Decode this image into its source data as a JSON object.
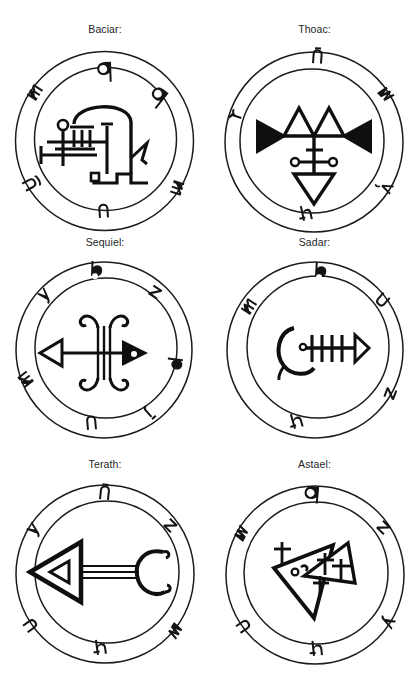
{
  "page": {
    "background_color": "#ffffff",
    "ink_color": "#100e0e",
    "layout": "2 columns x 3 rows grid of circular demon seals",
    "width": 419,
    "height": 690
  },
  "seals": [
    {
      "id": "baciar",
      "label": "Baciar:",
      "row": 1,
      "column": 1,
      "ring_glyph_count": 6,
      "ring_glyphs": [
        "glyph-q",
        "glyph-q2",
        "glyph-m",
        "glyph-m2",
        "glyph-u",
        "glyph-n"
      ],
      "center_figure": "comb-and-hook sigil: horizontal ladder bars with small circle terminal, arched dome, hooked tail and square foot"
    },
    {
      "id": "thoac",
      "label": "Thoac:",
      "row": 1,
      "column": 2,
      "ring_glyph_count": 5,
      "ring_glyphs": [
        "glyph-n",
        "glyph-w",
        "glyph-r",
        "glyph-v",
        "glyph-h"
      ],
      "center_figure": "two filled arrowheads pointing outward, twin open peaks above, barred cross with two dot terminals, open downward triangle below"
    },
    {
      "id": "sequiel",
      "label": "Sequiel:",
      "row": 2,
      "column": 1,
      "ring_glyph_count": 7,
      "ring_glyphs": [
        "glyph-b",
        "glyph-y",
        "glyph-z",
        "glyph-m",
        "glyph-p",
        "glyph-j",
        "glyph-n"
      ],
      "center_figure": "double-line vertical column with scrolled hooks top and bottom, open left arrowhead and filled right arrowhead on crossbar"
    },
    {
      "id": "sadar",
      "label": "Sadar:",
      "row": 2,
      "column": 2,
      "ring_glyph_count": 5,
      "ring_glyphs": [
        "glyph-b",
        "glyph-u",
        "glyph-m",
        "glyph-z",
        "glyph-h"
      ],
      "center_figure": "fishbone sigil: crescent with dot at left, spine with four vertical ribs, small open triangle head at right"
    },
    {
      "id": "terath",
      "label": "Terath:",
      "row": 3,
      "column": 1,
      "ring_glyph_count": 6,
      "ring_glyphs": [
        "glyph-n",
        "glyph-z",
        "glyph-y",
        "glyph-w",
        "glyph-u",
        "glyph-h"
      ],
      "center_figure": "left-pointing hollow triangle with inner triangle, triple-line shaft, scrolled C crescent at right"
    },
    {
      "id": "astael",
      "label": "Astael:",
      "row": 3,
      "column": 2,
      "ring_glyph_count": 6,
      "ring_glyphs": [
        "glyph-q",
        "glyph-z",
        "glyph-y",
        "glyph-w",
        "glyph-u",
        "glyph-h"
      ],
      "center_figure": "two overlapping hollow triangles with small cross marks and a dotted eye"
    }
  ]
}
